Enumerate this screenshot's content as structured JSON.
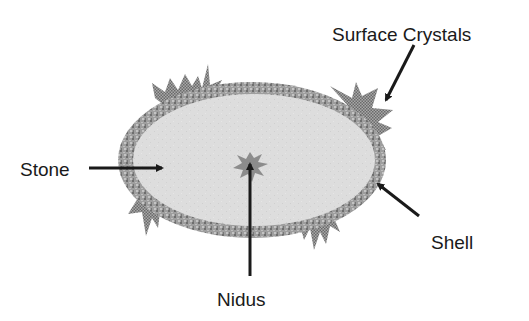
{
  "diagram": {
    "type": "labeled-cross-section",
    "subject": "stone",
    "labels": {
      "surface_crystals": "Surface Crystals",
      "stone": "Stone",
      "nidus": "Nidus",
      "shell": "Shell"
    },
    "colors": {
      "background": "#ffffff",
      "stone_fill": "#dcdcdc",
      "shell_fill": "#9a9a9a",
      "crystal_fill": "#8a8a8a",
      "nidus_fill": "#8c8c8c",
      "arrow": "#1a1a1a",
      "text": "#1a1a1a"
    }
  }
}
